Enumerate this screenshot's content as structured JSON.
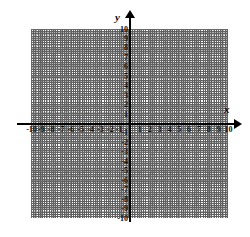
{
  "figure": {
    "kind": "cartesian-coordinate-plane",
    "background_color": "#ffffff",
    "axis_color": "#000000",
    "major_gridline_color": "#707070",
    "minor_gridline_color": "#b8b8b8",
    "label_color": "#111111"
  },
  "axes": {
    "x_name": "x",
    "y_name": "y",
    "x_arrow": "arrow-right",
    "y_arrow": "arrow-up",
    "minor_divisions_per_unit": 3
  },
  "chart_data": {
    "type": "scatter",
    "title": "",
    "xlabel": "x",
    "ylabel": "y",
    "xlim": [
      -10,
      10
    ],
    "ylim": [
      -10,
      10
    ],
    "grid": true,
    "legend": null,
    "series": [],
    "x": [],
    "y": [],
    "xticks": [
      -10,
      -9,
      -8,
      -7,
      -6,
      -5,
      -4,
      -3,
      -2,
      -1,
      1,
      2,
      3,
      4,
      5,
      6,
      7,
      8,
      9,
      10
    ],
    "yticks": [
      10,
      9,
      8,
      7,
      6,
      5,
      4,
      3,
      2,
      1,
      -1,
      -2,
      -3,
      -4,
      -5,
      -6,
      -7,
      -8,
      -9,
      -10
    ],
    "xtick_labels": [
      "-10",
      "-9",
      "-8",
      "-7",
      "-6",
      "-5",
      "-4",
      "-3",
      "-2",
      "-1",
      "1",
      "2",
      "3",
      "4",
      "5",
      "6",
      "7",
      "8",
      "9",
      "10"
    ],
    "ytick_labels": [
      "10",
      "9",
      "8",
      "7",
      "6",
      "5",
      "4",
      "3",
      "2",
      "1",
      "-1",
      "-2",
      "-3",
      "-4",
      "-5",
      "-6",
      "-7",
      "-8",
      "-9",
      "-10"
    ],
    "annotations": []
  }
}
